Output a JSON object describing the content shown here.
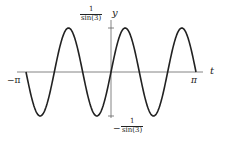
{
  "chart_data": {
    "type": "line",
    "title": "",
    "xlabel": "t",
    "ylabel": "y",
    "function": "sin(3t)/sin(3) (scaled sinusoid, 3 periods over [-pi, pi])",
    "xlim": [
      -3.14159,
      3.14159
    ],
    "ylim_labels": [
      "-1/sin(3)",
      "1/sin(3)"
    ],
    "x_ticks": [
      {
        "value": -3.14159,
        "label": "−π"
      },
      {
        "value": 3.14159,
        "label": "π"
      }
    ],
    "y_ticks": [
      {
        "value": 1,
        "label_num": "1",
        "label_den": "sin(3)",
        "label_sign": ""
      },
      {
        "value": -1,
        "label_num": "1",
        "label_den": "sin(3)",
        "label_sign": "−"
      }
    ],
    "series": [
      {
        "name": "y(t)",
        "frequency": 3,
        "amplitude": 1,
        "starts_direction": "down",
        "x": [
          -3.14159,
          -2.618,
          -2.094,
          -1.571,
          -1.047,
          -0.524,
          0,
          0.524,
          1.047,
          1.571,
          2.094,
          2.618,
          3.14159
        ],
        "values": [
          0,
          -1,
          0,
          1,
          0,
          -1,
          0,
          1,
          0,
          -1,
          0,
          1,
          0
        ]
      }
    ],
    "grid": false,
    "legend": null,
    "color": "#222222"
  },
  "labels": {
    "x_axis": "t",
    "y_axis": "y",
    "x_min": "−π",
    "x_max": "π",
    "y_top_num": "1",
    "y_top_den": "sin(3)",
    "y_bot_sign": "−",
    "y_bot_num": "1",
    "y_bot_den": "sin(3)"
  }
}
